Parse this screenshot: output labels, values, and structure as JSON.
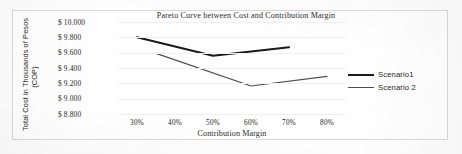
{
  "chart_data": {
    "type": "line",
    "title": "Pareto Curve between Cost and Contribution Margin",
    "xlabel": "Contribution Margin",
    "ylabel": "Total Cost in Thousands of Pesos (COP)",
    "ylabel_line1": "Total Cost in Thousands of Pesos",
    "ylabel_line2": "(COP)",
    "categories": [
      "30%",
      "40%",
      "50%",
      "60%",
      "70%",
      "80%"
    ],
    "x": [
      30,
      40,
      50,
      60,
      70,
      80
    ],
    "xlim": [
      25,
      85
    ],
    "ylim": [
      8800,
      10000
    ],
    "ytick_labels": [
      "$ 10.000",
      "$ 9.800",
      "$ 9.600",
      "$ 9.400",
      "$ 9.200",
      "$ 9.000",
      "$ 8.800"
    ],
    "ytick_values": [
      10000,
      9800,
      9600,
      9400,
      9200,
      9000,
      8800
    ],
    "grid": true,
    "legend_position": "right",
    "series": [
      {
        "name": "Scenario1",
        "color": "#1a1a1a",
        "width": 2.1,
        "x": [
          30,
          50,
          70
        ],
        "values": [
          9800,
          9560,
          9670
        ]
      },
      {
        "name": "Scenario 2",
        "color": "#4d4d4d",
        "width": 1.2,
        "x": [
          35,
          60,
          80
        ],
        "values": [
          9590,
          9165,
          9290
        ]
      }
    ]
  },
  "legend": {
    "items": [
      {
        "label": "Scenario1"
      },
      {
        "label": "Scenario 2"
      }
    ]
  },
  "colors": {
    "series1": "#1a1a1a",
    "series2": "#4d4d4d",
    "grid": "#f0f0f0",
    "frame": "#d9d9d9",
    "text": "#242424"
  }
}
